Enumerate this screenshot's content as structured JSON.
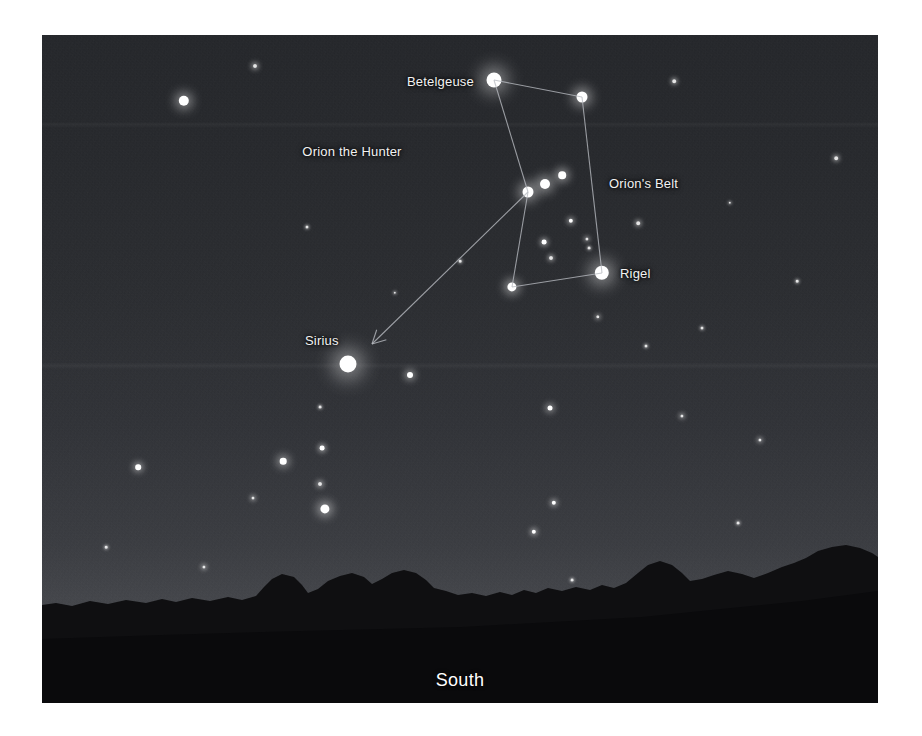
{
  "scene": {
    "title": "Orion the Hunter night sky star chart",
    "direction_label": "South",
    "constellation_label": "Orion the Hunter",
    "background_colors": {
      "sky_top": "#24262a",
      "sky_horizon": "#4c4e53",
      "treeline": "#101012",
      "ground": "#0b0b0d",
      "star_color": "#ffffff",
      "line_color": "#b9bcc2",
      "label_color": "#f2f2f2",
      "frame_background": "#ffffff"
    }
  },
  "labels": [
    {
      "name": "betelgeuse",
      "text": "Betelgeuse",
      "x": 432,
      "y": 46,
      "anchor": "right",
      "style": "plain"
    },
    {
      "name": "orions-belt",
      "text": "Orion's Belt",
      "x": 567,
      "y": 148,
      "anchor": "left",
      "style": "plain"
    },
    {
      "name": "rigel",
      "text": "Rigel",
      "x": 578,
      "y": 238,
      "anchor": "left",
      "style": "plain"
    },
    {
      "name": "sirius",
      "text": "Sirius",
      "x": 263,
      "y": 305,
      "anchor": "left",
      "style": "plain"
    },
    {
      "name": "orion-the-hunter",
      "text": "Orion the Hunter",
      "x": 310,
      "y": 116,
      "anchor": "center",
      "style": "italic"
    },
    {
      "name": "south",
      "text": "South",
      "x": 418,
      "y": 645,
      "anchor": "center",
      "style": "direction"
    }
  ],
  "named_stars": [
    {
      "name": "Betelgeuse",
      "x": 452,
      "y": 45,
      "radius": 7.5,
      "glow": 17
    },
    {
      "name": "Bellatrix",
      "x": 540,
      "y": 62,
      "radius": 5.5,
      "glow": 12
    },
    {
      "name": "Alnitak",
      "x": 486,
      "y": 157,
      "radius": 5.5,
      "glow": 12
    },
    {
      "name": "Alnilam",
      "x": 503,
      "y": 149,
      "radius": 5.0,
      "glow": 11
    },
    {
      "name": "Mintaka",
      "x": 520,
      "y": 140,
      "radius": 3.8,
      "glow": 9
    },
    {
      "name": "Saiph",
      "x": 470,
      "y": 252,
      "radius": 4.6,
      "glow": 10
    },
    {
      "name": "Rigel",
      "x": 560,
      "y": 238,
      "radius": 7.2,
      "glow": 16
    },
    {
      "name": "Sirius",
      "x": 306,
      "y": 329,
      "radius": 8.5,
      "glow": 19
    }
  ],
  "field_stars": [
    {
      "x": 142,
      "y": 66,
      "radius": 5.2,
      "glow": 11
    },
    {
      "x": 213,
      "y": 31,
      "radius": 2.0,
      "glow": 5
    },
    {
      "x": 265,
      "y": 192,
      "radius": 1.5,
      "glow": 3
    },
    {
      "x": 529,
      "y": 186,
      "radius": 2.2,
      "glow": 5
    },
    {
      "x": 545,
      "y": 204,
      "radius": 1.6,
      "glow": 4
    },
    {
      "x": 502,
      "y": 207,
      "radius": 2.4,
      "glow": 5
    },
    {
      "x": 509,
      "y": 223,
      "radius": 2.0,
      "glow": 4
    },
    {
      "x": 596,
      "y": 188,
      "radius": 1.8,
      "glow": 4
    },
    {
      "x": 556,
      "y": 282,
      "radius": 1.7,
      "glow": 4
    },
    {
      "x": 547,
      "y": 213,
      "radius": 1.4,
      "glow": 3
    },
    {
      "x": 368,
      "y": 340,
      "radius": 3.0,
      "glow": 7
    },
    {
      "x": 278,
      "y": 372,
      "radius": 1.4,
      "glow": 3
    },
    {
      "x": 508,
      "y": 373,
      "radius": 2.5,
      "glow": 6
    },
    {
      "x": 632,
      "y": 46,
      "radius": 1.8,
      "glow": 4
    },
    {
      "x": 794,
      "y": 123,
      "radius": 1.8,
      "glow": 4
    },
    {
      "x": 660,
      "y": 293,
      "radius": 1.5,
      "glow": 3
    },
    {
      "x": 604,
      "y": 311,
      "radius": 1.5,
      "glow": 3
    },
    {
      "x": 241,
      "y": 426,
      "radius": 3.3,
      "glow": 8
    },
    {
      "x": 278,
      "y": 449,
      "radius": 2.0,
      "glow": 5
    },
    {
      "x": 280,
      "y": 413,
      "radius": 2.4,
      "glow": 5
    },
    {
      "x": 283,
      "y": 474,
      "radius": 4.6,
      "glow": 10
    },
    {
      "x": 211,
      "y": 463,
      "radius": 1.5,
      "glow": 4
    },
    {
      "x": 96,
      "y": 432,
      "radius": 2.8,
      "glow": 6
    },
    {
      "x": 512,
      "y": 468,
      "radius": 2.2,
      "glow": 5
    },
    {
      "x": 492,
      "y": 497,
      "radius": 2.2,
      "glow": 5
    },
    {
      "x": 640,
      "y": 381,
      "radius": 1.6,
      "glow": 4
    },
    {
      "x": 162,
      "y": 532,
      "radius": 1.6,
      "glow": 4
    },
    {
      "x": 253,
      "y": 564,
      "radius": 1.7,
      "glow": 4
    },
    {
      "x": 369,
      "y": 549,
      "radius": 1.5,
      "glow": 3
    },
    {
      "x": 530,
      "y": 545,
      "radius": 1.4,
      "glow": 3
    },
    {
      "x": 718,
      "y": 405,
      "radius": 1.6,
      "glow": 4
    },
    {
      "x": 696,
      "y": 488,
      "radius": 1.4,
      "glow": 3
    },
    {
      "x": 64,
      "y": 512,
      "radius": 1.3,
      "glow": 3
    },
    {
      "x": 418,
      "y": 226,
      "radius": 1.3,
      "glow": 3
    },
    {
      "x": 353,
      "y": 258,
      "radius": 1.2,
      "glow": 3
    },
    {
      "x": 755,
      "y": 246,
      "radius": 1.3,
      "glow": 3
    },
    {
      "x": 688,
      "y": 168,
      "radius": 1.2,
      "glow": 3
    },
    {
      "x": 302,
      "y": 560,
      "radius": 1.6,
      "glow": 4
    },
    {
      "x": 760,
      "y": 541,
      "radius": 1.4,
      "glow": 3
    }
  ],
  "constellation_lines": [
    {
      "name": "betelgeuse-to-bellatrix",
      "x1": 452,
      "y1": 45,
      "x2": 540,
      "y2": 62
    },
    {
      "name": "betelgeuse-to-belt",
      "x1": 452,
      "y1": 45,
      "x2": 486,
      "y2": 157
    },
    {
      "name": "bellatrix-to-rigel",
      "x1": 540,
      "y1": 62,
      "x2": 560,
      "y2": 238
    },
    {
      "name": "belt-to-saiph",
      "x1": 486,
      "y1": 157,
      "x2": 470,
      "y2": 252
    },
    {
      "name": "saiph-to-rigel",
      "x1": 470,
      "y1": 252,
      "x2": 560,
      "y2": 238
    }
  ],
  "pointer_arrow": {
    "name": "belt-to-sirius-arrow",
    "x1": 486,
    "y1": 157,
    "x2": 330,
    "y2": 309,
    "description": "Arrow from Orion's Belt pointing down-left to Sirius"
  }
}
